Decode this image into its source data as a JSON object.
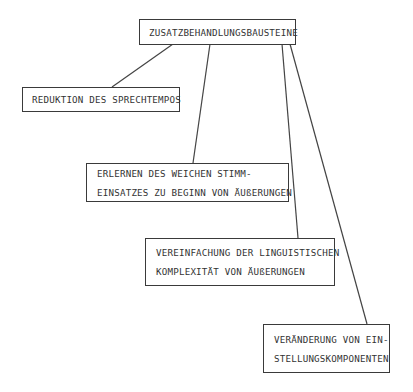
{
  "diagram": {
    "root": {
      "label": "ZUSATZBEHANDLUNGSBAUSTEINE"
    },
    "children": [
      {
        "lines": [
          "REDUKTION DES SPRECHTEMPOS"
        ]
      },
      {
        "lines": [
          "ERLERNEN DES WEICHEN STIMM-",
          "EINSATZES ZU BEGINN VON ÄUßERUNGEN"
        ]
      },
      {
        "lines": [
          "VEREINFACHUNG DER LINGUISTISCHEN",
          "KOMPLEXITÄT VON ÄUßERUNGEN"
        ]
      },
      {
        "lines": [
          "VERÄNDERUNG VON EIN-",
          "STELLUNGSKOMPONENTEN"
        ]
      }
    ]
  },
  "colors": {
    "stroke": "#3a3a3a",
    "text": "#333333",
    "background": "#ffffff"
  }
}
